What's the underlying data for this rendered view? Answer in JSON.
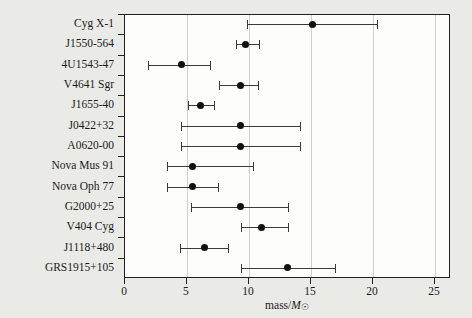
{
  "chart_data": {
    "type": "scatter",
    "title": "",
    "xlabel": "mass/M☉",
    "ylabel": "",
    "xlim": [
      0,
      26.3
    ],
    "grid": true,
    "legend": null,
    "orientation": "horizontal",
    "error_bars": "x",
    "categories": [
      "Cyg X-1",
      "J1550-564",
      "4U1543-47",
      "V4641 Sgr",
      "J1655-40",
      "J0422+32",
      "A0620-00",
      "Nova Mus 91",
      "Nova Oph 77",
      "G2000+25",
      "V404 Cyg",
      "J1118+480",
      "GRS1915+105"
    ],
    "x_ticks": [
      0,
      5,
      10,
      15,
      20,
      25
    ],
    "x_tick_labels": [
      "0",
      "5",
      "10",
      "15",
      "20",
      "25"
    ],
    "points": [
      {
        "label": "Cyg X-1",
        "value": 15.2,
        "low": 9.9,
        "high": 20.4
      },
      {
        "label": "J1550-564",
        "value": 9.8,
        "low": 9.0,
        "high": 10.9
      },
      {
        "label": "4U1543-47",
        "value": 4.6,
        "low": 1.9,
        "high": 6.9
      },
      {
        "label": "V4641 Sgr",
        "value": 9.4,
        "low": 7.7,
        "high": 10.8
      },
      {
        "label": "J1655-40",
        "value": 6.2,
        "low": 5.2,
        "high": 7.3
      },
      {
        "label": "J0422+32",
        "value": 9.4,
        "low": 4.6,
        "high": 14.2
      },
      {
        "label": "A0620-00",
        "value": 9.4,
        "low": 4.6,
        "high": 14.2
      },
      {
        "label": "Nova Mus 91",
        "value": 5.5,
        "low": 3.5,
        "high": 10.4
      },
      {
        "label": "Nova Oph 77",
        "value": 5.5,
        "low": 3.5,
        "high": 7.6
      },
      {
        "label": "G2000+25",
        "value": 9.4,
        "low": 5.4,
        "high": 13.2
      },
      {
        "label": "V404 Cyg",
        "value": 11.1,
        "low": 9.4,
        "high": 13.2
      },
      {
        "label": "J1118+480",
        "value": 6.5,
        "low": 4.5,
        "high": 8.4
      },
      {
        "label": "GRS1915+105",
        "value": 13.2,
        "low": 9.4,
        "high": 17.0
      }
    ],
    "colors": {
      "marker": "#111111",
      "errorbar": "#3a3a3a",
      "grid": "#cfcfcb",
      "axis": "#231f20",
      "plot_background": "#fdfdfc",
      "figure_background": "#eaeae7"
    }
  },
  "axis_title_parts": {
    "prefix": "mass/",
    "symbol": "M",
    "subscript": "☉"
  }
}
